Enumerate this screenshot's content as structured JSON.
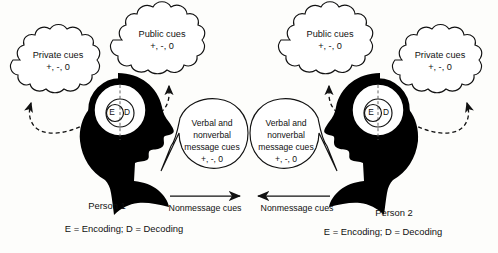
{
  "diagram": {
    "background_color": "#fdfdfb",
    "ink_color": "#111111",
    "silhouette_color": "#000000",
    "signs_text": "+, -, 0"
  },
  "left": {
    "private_cloud": {
      "label": "Private cues",
      "signs": "+, -, 0"
    },
    "public_cloud": {
      "label": "Public cues",
      "signs": "+, -, 0"
    },
    "bubble": {
      "line1": "Verbal and",
      "line2": "nonverbal",
      "line3": "message cues",
      "signs": "+, -, 0"
    },
    "head": {
      "encoding_letter": "E",
      "decoding_letter": "D"
    },
    "person_label": "Person  1",
    "legend": "E = Encoding;  D = Decoding",
    "flow_label": "Nonmessage  cues"
  },
  "right": {
    "private_cloud": {
      "label": "Private cues",
      "signs": "+, -, 0"
    },
    "public_cloud": {
      "label": "Public cues",
      "signs": "+, -, 0"
    },
    "bubble": {
      "line1": "Verbal and",
      "line2": "nonverbal",
      "line3": "message cues",
      "signs": "+, -, 0"
    },
    "head": {
      "encoding_letter": "E",
      "decoding_letter": "D"
    },
    "person_label": "Person  2",
    "legend": "E  = Encoding;  D = Decoding",
    "flow_label": "Nonmessage  cues"
  }
}
